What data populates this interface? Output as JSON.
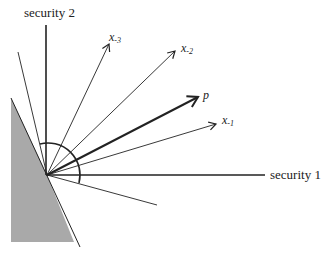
{
  "diagram": {
    "axes": {
      "x_label": "security 1",
      "y_label": "security 2"
    },
    "vectors": [
      {
        "name": "x",
        "sub": "-3"
      },
      {
        "name": "x",
        "sub": "-2"
      },
      {
        "name": "p",
        "sub": ""
      },
      {
        "name": "x",
        "sub": "-1"
      }
    ],
    "colors": {
      "shade": "#a9a9a9",
      "line": "#222222"
    }
  }
}
